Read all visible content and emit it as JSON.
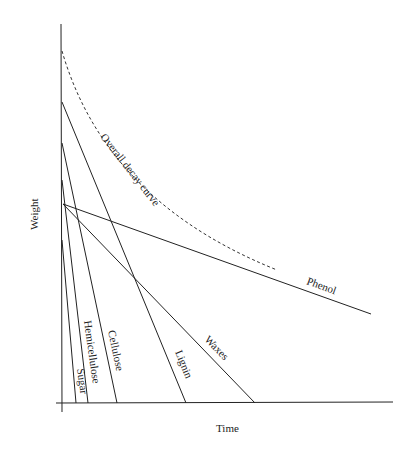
{
  "diagram": {
    "xlabel": "Time",
    "ylabel": "Weight",
    "curve_label": "Overall decay curve",
    "components": [
      {
        "name": "Sugar",
        "label": "Sugar"
      },
      {
        "name": "Hemicellulose",
        "label": "Hemicellulose"
      },
      {
        "name": "Cellulose",
        "label": "Cellulose"
      },
      {
        "name": "Lignin",
        "label": "Lignin"
      },
      {
        "name": "Waxes",
        "label": "Waxes"
      },
      {
        "name": "Phenol",
        "label": "Phenol"
      }
    ]
  }
}
